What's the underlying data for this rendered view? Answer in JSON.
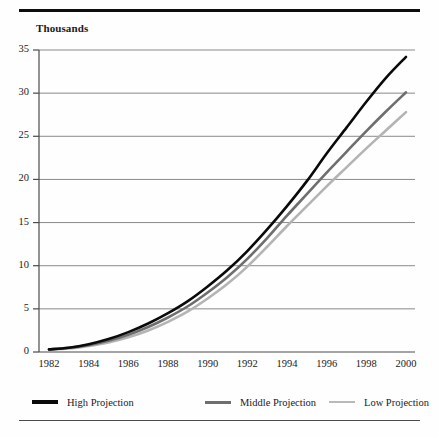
{
  "chart_data": {
    "type": "line",
    "title": "",
    "subtitle": "",
    "ylabel": "Thousands",
    "xlabel": "",
    "grid": true,
    "legend_position": "bottom",
    "xlim": [
      1982,
      2000
    ],
    "ylim": [
      0,
      35
    ],
    "yticks": [
      0,
      5,
      10,
      15,
      20,
      25,
      30,
      35
    ],
    "xticks": [
      1982,
      1984,
      1986,
      1988,
      1990,
      1992,
      1994,
      1996,
      1998,
      2000
    ],
    "x": [
      1982,
      1983,
      1984,
      1985,
      1986,
      1987,
      1988,
      1989,
      1990,
      1991,
      1992,
      1993,
      1994,
      1995,
      1996,
      1997,
      1998,
      1999,
      2000
    ],
    "series": [
      {
        "name": "High Projection",
        "color": "#0a0a0a",
        "width": 2.6,
        "values": [
          0.3,
          0.5,
          0.9,
          1.5,
          2.3,
          3.3,
          4.5,
          5.9,
          7.6,
          9.5,
          11.7,
          14.2,
          16.9,
          19.8,
          23.0,
          26.0,
          29.0,
          31.8,
          34.2
        ]
      },
      {
        "name": "Middle Projection",
        "color": "#6e6e6e",
        "width": 2.6,
        "values": [
          0.3,
          0.5,
          0.8,
          1.3,
          2.0,
          2.9,
          4.0,
          5.3,
          6.9,
          8.7,
          10.8,
          13.2,
          15.8,
          18.3,
          20.8,
          23.2,
          25.6,
          27.9,
          30.1
        ]
      },
      {
        "name": "Low Projection",
        "color": "#b4b4b4",
        "width": 2.6,
        "values": [
          0.3,
          0.4,
          0.7,
          1.1,
          1.7,
          2.5,
          3.5,
          4.7,
          6.2,
          7.9,
          9.9,
          12.2,
          14.6,
          16.9,
          19.2,
          21.4,
          23.6,
          25.7,
          27.8
        ]
      }
    ]
  },
  "legend": {
    "items": [
      {
        "label": "High Projection",
        "color": "#0a0a0a",
        "thickness": "4px"
      },
      {
        "label": "Middle Projection",
        "color": "#6e6e6e",
        "thickness": "3px"
      },
      {
        "label": "Low Projection",
        "color": "#b9b9b9",
        "thickness": "2px"
      }
    ]
  },
  "ytick_labels": [
    "35",
    "30",
    "25",
    "20",
    "15",
    "10",
    "5",
    "0"
  ],
  "xtick_labels": [
    "1982",
    "1984",
    "1986",
    "1988",
    "1990",
    "1992",
    "1994",
    "1996",
    "1998",
    "2000"
  ],
  "colors": {
    "grid": "#8a8a8a",
    "axis": "#4a4a4a",
    "rule_top": "#0d0d0d",
    "rule_bottom": "#4a4a4a"
  }
}
